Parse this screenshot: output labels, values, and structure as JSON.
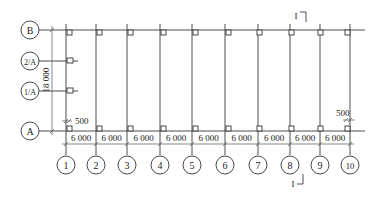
{
  "diagram": {
    "type": "structural-grid-plan",
    "column_axes": [
      {
        "label": "1",
        "x": 66
      },
      {
        "label": "2",
        "x": 96
      },
      {
        "label": "3",
        "x": 127
      },
      {
        "label": "4",
        "x": 160
      },
      {
        "label": "5",
        "x": 192
      },
      {
        "label": "6",
        "x": 225
      },
      {
        "label": "7",
        "x": 258
      },
      {
        "label": "8",
        "x": 290
      },
      {
        "label": "9",
        "x": 320
      },
      {
        "label": "10",
        "x": 350
      }
    ],
    "row_axes": [
      {
        "label": "B",
        "y": 30
      },
      {
        "label": "2/A",
        "y": 61
      },
      {
        "label": "1/A",
        "y": 91
      },
      {
        "label": "A",
        "y": 131
      }
    ],
    "bay_dimensions": [
      "6 000",
      "6 000",
      "6 000",
      "6 000",
      "6 000",
      "6 000",
      "6 000",
      "6 000",
      "6 000"
    ],
    "span_dimension": "18 000",
    "offset_left": "500",
    "offset_right": "500",
    "section_mark": {
      "label": "I",
      "top_label": "I",
      "bottom_label": "I"
    }
  }
}
